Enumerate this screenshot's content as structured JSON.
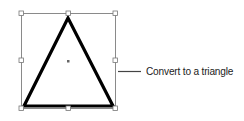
{
  "figure": {
    "shape": "isosceles-triangle",
    "callout_text": "Convert to a triangle",
    "stroke_color": "#000000",
    "selection_box_color": "#8a8a8a",
    "handle_fill": "#ffffff",
    "handle_stroke": "#777777",
    "callout_line_color": "#444444"
  }
}
